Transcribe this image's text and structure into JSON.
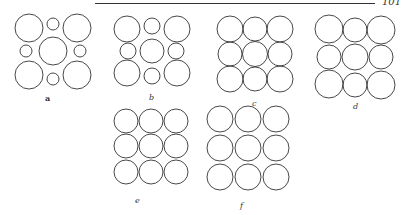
{
  "header": {
    "page_number": "101"
  },
  "figures": [
    {
      "id": "a",
      "label": "a",
      "description": "4 large corner circles, large central circle, 4 small interstitial circles"
    },
    {
      "id": "b",
      "label": "b",
      "description": "4 large corner circles, medium center circle, 4 medium edge circles"
    },
    {
      "id": "c",
      "label": "c",
      "description": "3x3 grid of near-equal circles"
    },
    {
      "id": "d",
      "label": "d",
      "description": "3x3 grid of near-equal circles, slightly larger corners"
    },
    {
      "id": "e",
      "label": "e",
      "description": "3x3 grid of equal overlapping circles, alternating front/back"
    },
    {
      "id": "f",
      "label": "f",
      "description": "3x3 grid of equal overlapping circles, alternating front/back"
    }
  ]
}
